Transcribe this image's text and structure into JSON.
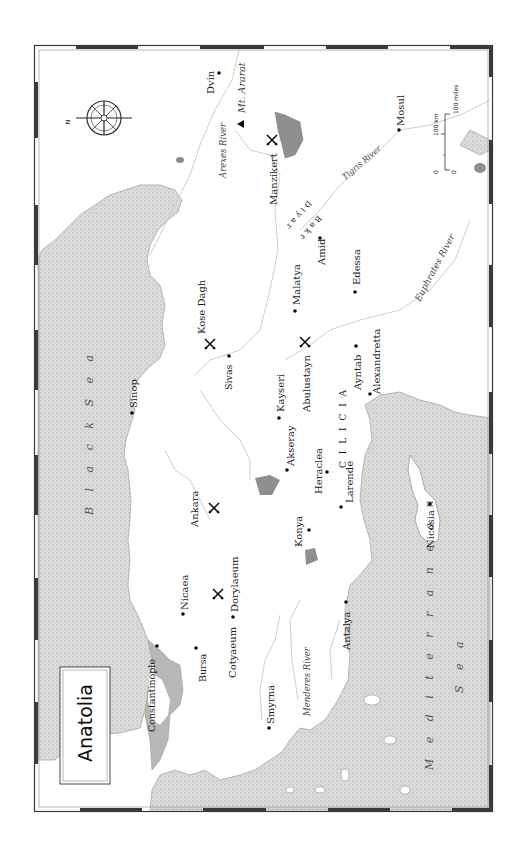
{
  "map": {
    "title": "Anatolia",
    "compass": {
      "label": "N"
    },
    "scale_bar": {
      "km_label": "100 km",
      "miles_label": "100 miles",
      "zero_km": "0",
      "zero_miles": "0"
    },
    "seas": [
      {
        "name": "Black Sea",
        "text": "B l a c k   S e a"
      },
      {
        "name": "Mediterranean Sea",
        "line1": "M e d i t e r r a n e a n",
        "line2": "S e a"
      }
    ],
    "rivers": [
      "Arexes River",
      "Tigris River",
      "Euphrates River",
      "Menderes River"
    ],
    "regions": [
      "CILICIA",
      "Diyar Bakr"
    ],
    "mountains": [
      "Mt. Ararat"
    ],
    "cities": [
      "Dvin",
      "Mosul",
      "Amid",
      "Edessa",
      "Malatya",
      "Sivas",
      "Kayseri",
      "Akseray",
      "Heraclea",
      "Larende",
      "Konya",
      "Ayntab",
      "Alexandretta",
      "Sinop",
      "Ankara",
      "Dorylaeum",
      "Nicaea",
      "Bursa",
      "Cotyaeum",
      "Constantinople",
      "Smyrna",
      "Antalya",
      "Nicosia"
    ],
    "battles": [
      "Manzikert",
      "Kose Dagh",
      "Abulustayn",
      "Ankara",
      "Dorylaeum"
    ],
    "labels": {
      "dvin": "Dvin",
      "ararat": "Mt. Ararat",
      "arexes": "Arexes River",
      "manzikert": "Manzikert",
      "mosul": "Mosul",
      "tigris": "Tigris River",
      "diyar": "Diyar",
      "bakr": "Bakr",
      "amid": "Amid",
      "edessa": "Edessa",
      "euphrates": "Euphrates River",
      "malatya": "Malatya",
      "kose": "Kose Dagh",
      "sivas": "Sivas",
      "kayseri": "Kayseri",
      "abulustayn": "Abulustayn",
      "cilicia": "C I L I C I A",
      "ayntab": "Ayntab",
      "alexandretta": "Alexandretta",
      "sinop": "Sinop",
      "akseray": "Akseray",
      "heraclea": "Heraclea",
      "larende": "Larende",
      "ankara": "Ankara",
      "konya": "Konya",
      "nicosia": "Nicosia",
      "dorylaeum": "Dorylaeum",
      "nicaea": "Nicaea",
      "bursa": "Bursa",
      "cotyaeum": "Cotyaeum",
      "constantinople": "Constantinople",
      "smyrna": "Smyrna",
      "menderes": "Menderes River",
      "antalya": "Antalya"
    },
    "colors": {
      "sea": "#d6d6d6",
      "coast": "#a8a8a8",
      "lake": "#8f8f8f",
      "river": "#c8c8c8",
      "frame": "#3a3a3a"
    }
  }
}
